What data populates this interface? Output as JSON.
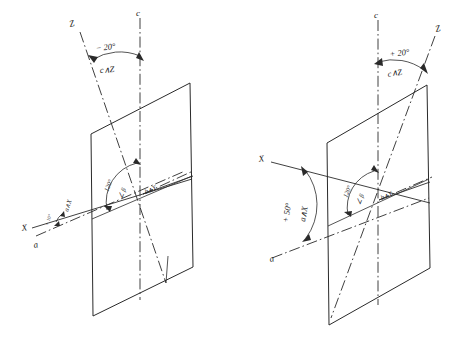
{
  "figure": {
    "background_color": "#ffffff",
    "ink_color": "#1a1a1a"
  },
  "diagrams": [
    {
      "id": "left",
      "name": "negative-extinction-diagram",
      "axes": [
        {
          "name": "c-axis",
          "label": "c",
          "kind": "crystal",
          "style": "dash-dot"
        },
        {
          "name": "a-axis",
          "label": "a",
          "kind": "crystal",
          "style": "dash-dot"
        },
        {
          "name": "b-axis",
          "label": "b",
          "kind": "crystal",
          "style": "dash-dot"
        },
        {
          "name": "Z-axis",
          "label": "Z",
          "kind": "optical",
          "style": "dash-dot"
        },
        {
          "name": "X-axis",
          "label": "X",
          "kind": "optical",
          "style": "solid"
        },
        {
          "name": "Y-axis",
          "label": "Y",
          "kind": "optical",
          "style": "solid"
        }
      ],
      "angles": [
        {
          "name": "c-wedge-Z-angle",
          "value": "− 20°",
          "relation": "c∧Z"
        },
        {
          "name": "a-wedge-X-angle",
          "value": "+ 10°",
          "relation": "a∧X"
        },
        {
          "name": "beta-angle",
          "value": "120°",
          "relation": "∠ β"
        },
        {
          "name": "b-wedge-Y-angle",
          "value": "",
          "relation": "b∧Y"
        }
      ]
    },
    {
      "id": "right",
      "name": "positive-extinction-diagram",
      "axes": [
        {
          "name": "c-axis",
          "label": "c",
          "kind": "crystal",
          "style": "dash-dot"
        },
        {
          "name": "a-axis",
          "label": "a",
          "kind": "crystal",
          "style": "dash-dot"
        },
        {
          "name": "b-axis",
          "label": "b",
          "kind": "crystal",
          "style": "dash-dot"
        },
        {
          "name": "Z-axis",
          "label": "Z",
          "kind": "optical",
          "style": "dash-dot"
        },
        {
          "name": "X-axis",
          "label": "X",
          "kind": "optical",
          "style": "solid"
        },
        {
          "name": "Y-axis",
          "label": "Y",
          "kind": "optical",
          "style": "solid"
        }
      ],
      "angles": [
        {
          "name": "c-wedge-Z-angle",
          "value": "+ 20°",
          "relation": "c∧Z"
        },
        {
          "name": "a-wedge-X-angle",
          "value": "+ 50°",
          "relation": "a∧X"
        },
        {
          "name": "beta-angle",
          "value": "120°",
          "relation": "∠ β"
        },
        {
          "name": "b-wedge-Y-angle",
          "value": "",
          "relation": "b∧Y"
        }
      ]
    }
  ],
  "labels": {
    "left": {
      "c": "c",
      "z": "Z",
      "x": "X",
      "a": "a",
      "cz_value": "− 20°",
      "cz_relation": "c∧Z",
      "ax_value": "+ 10°",
      "ax_relation": "a∧X",
      "beta_value": "120°",
      "beta_relation": "∠ β",
      "by_relation": "b∧Y"
    },
    "right": {
      "c": "c",
      "z": "Z",
      "x": "X",
      "a": "a",
      "cz_value": "+ 20°",
      "cz_relation": "c∧Z",
      "ax_value": "+ 50°",
      "ax_relation": "a∧X",
      "beta_value": "120°",
      "beta_relation": "∠ β",
      "by_relation": "b∧Y"
    }
  }
}
